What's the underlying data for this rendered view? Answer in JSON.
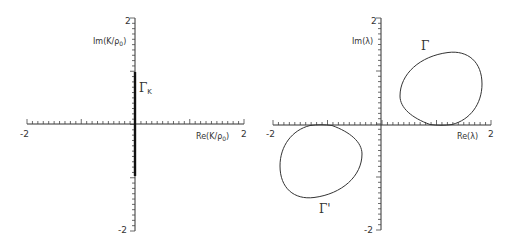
{
  "chart_data": [
    {
      "type": "line",
      "panel": "left",
      "title": "",
      "xlabel": "Re(K/ρ₀)",
      "ylabel": "Im(K/ρ₀)",
      "xlim": [
        -2,
        2
      ],
      "ylim": [
        -2,
        2
      ],
      "x_tick_labels": [
        "-2",
        "2"
      ],
      "y_tick_labels": [
        "2",
        "-2"
      ],
      "minor_tick_step": 0.1,
      "grid": false,
      "series": [
        {
          "name": "Γ_K",
          "label": "Γ",
          "label_sub": "K",
          "kind": "segment",
          "x": [
            0,
            0
          ],
          "y": [
            -0.95,
            1.0
          ]
        }
      ]
    },
    {
      "type": "line",
      "panel": "right",
      "title": "",
      "xlabel": "Re(λ)",
      "ylabel": "Im(λ)",
      "xlim": [
        -2,
        2
      ],
      "ylim": [
        -2,
        2
      ],
      "x_tick_labels": [
        "-2",
        "2"
      ],
      "y_tick_labels": [
        "2",
        "-2"
      ],
      "minor_tick_step": 0.1,
      "grid": false,
      "series": [
        {
          "name": "Γ",
          "label": "Γ",
          "kind": "closed-curve",
          "x_range": [
            0.35,
            1.85
          ],
          "y_range": [
            0.0,
            1.38
          ]
        },
        {
          "name": "Γ'",
          "label": "Γ'",
          "kind": "closed-curve",
          "x_range": [
            -1.85,
            -0.35
          ],
          "y_range": [
            -1.38,
            0.0
          ]
        }
      ]
    }
  ],
  "panels": {
    "left": {
      "xlabel": "Re(K/ρ",
      "xlabel_sub": "0",
      "xlabel_end": ")",
      "ylabel": "Im(K/ρ",
      "ylabel_sub": "0",
      "ylabel_end": ")",
      "x_min_label": "-2",
      "x_max_label": "2",
      "y_max_label": "2",
      "y_min_label": "-2",
      "curve_label": "Γ",
      "curve_label_sub": "K"
    },
    "right": {
      "xlabel": "Re(λ)",
      "ylabel": "Im(λ)",
      "x_min_label": "-2",
      "x_max_label": "2",
      "y_max_label": "2",
      "y_min_label": "-2",
      "curve_label_gamma": "Γ",
      "curve_label_gamma_prime": "Γ'"
    }
  }
}
